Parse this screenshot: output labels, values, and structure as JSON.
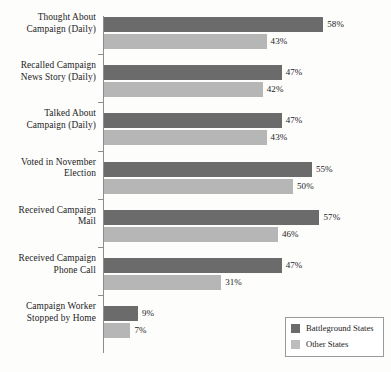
{
  "chart_data": {
    "type": "bar",
    "orientation": "horizontal",
    "title": "",
    "xlabel": "",
    "ylabel": "",
    "xlim": [
      0,
      75
    ],
    "grid": false,
    "legend_position": "bottom-right",
    "value_suffix": "%",
    "categories": [
      "Thought About\nCampaign (Daily)",
      "Recalled Campaign\nNews Story (Daily)",
      "Talked About\nCampaign (Daily)",
      "Voted in November\nElection",
      "Received Campaign\nMail",
      "Received Campaign\nPhone Call",
      "Campaign Worker\nStopped by Home"
    ],
    "category_lines": [
      [
        "Thought About",
        "Campaign (Daily)"
      ],
      [
        "Recalled Campaign",
        "News Story (Daily)"
      ],
      [
        "Talked About",
        "Campaign (Daily)"
      ],
      [
        "Voted in November",
        "Election"
      ],
      [
        "Received Campaign",
        "Mail"
      ],
      [
        "Received Campaign",
        "Phone Call"
      ],
      [
        "Campaign Worker",
        "Stopped by Home"
      ]
    ],
    "series": [
      {
        "name": "Battleground States",
        "color": "#6b6b6b",
        "values": [
          58,
          47,
          47,
          55,
          57,
          47,
          9
        ],
        "labels": [
          "58%",
          "47%",
          "47%",
          "55%",
          "57%",
          "47%",
          "9%"
        ]
      },
      {
        "name": "Other States",
        "color": "#b6b6b6",
        "values": [
          43,
          42,
          43,
          50,
          46,
          31,
          7
        ],
        "labels": [
          "43%",
          "42%",
          "43%",
          "50%",
          "46%",
          "31%",
          "7%"
        ]
      }
    ]
  },
  "legend": {
    "items": [
      {
        "label": "Battleground States",
        "color": "#6b6b6b"
      },
      {
        "label": "Other States",
        "color": "#bdbdbd"
      }
    ]
  },
  "title_remnant": " "
}
